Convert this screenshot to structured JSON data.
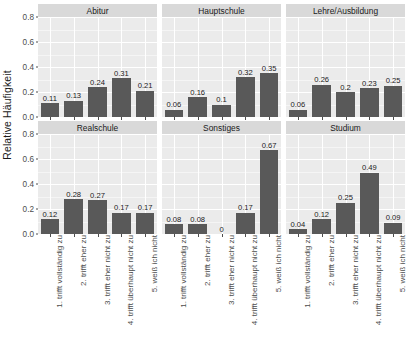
{
  "chart_data": {
    "type": "bar",
    "title": "",
    "subtitle": "",
    "xlabel": "",
    "ylabel": "Relative Häufigkeit",
    "ylim": [
      0,
      0.8
    ],
    "yticks": [
      "0.0",
      "0.2",
      "0.4",
      "0.6",
      "0.8"
    ],
    "ytick_values": [
      0.0,
      0.2,
      0.4,
      0.6,
      0.8
    ],
    "grid": true,
    "legend": "none",
    "facet_layout": {
      "rows": 2,
      "cols": 3
    },
    "categories": [
      "1. trifft vollständig zu",
      "2. trifft eher zu",
      "3. trifft eher nicht zu",
      "4. trifft überhaupt nicht zu",
      "5. weiß ich nicht"
    ],
    "panels": [
      {
        "name": "Abitur",
        "values": [
          0.11,
          0.13,
          0.24,
          0.31,
          0.21
        ],
        "labels": [
          "0.11",
          "0.13",
          "0.24",
          "0.31",
          "0.21"
        ]
      },
      {
        "name": "Hauptschule",
        "values": [
          0.06,
          0.16,
          0.1,
          0.32,
          0.35
        ],
        "labels": [
          "0.06",
          "0.16",
          "0.1",
          "0.32",
          "0.35"
        ]
      },
      {
        "name": "Lehre/Ausbildung",
        "values": [
          0.06,
          0.26,
          0.2,
          0.23,
          0.25
        ],
        "labels": [
          "0.06",
          "0.26",
          "0.2",
          "0.23",
          "0.25"
        ]
      },
      {
        "name": "Realschule",
        "values": [
          0.12,
          0.28,
          0.27,
          0.17,
          0.17
        ],
        "labels": [
          "0.12",
          "0.28",
          "0.27",
          "0.17",
          "0.17"
        ]
      },
      {
        "name": "Sonstiges",
        "values": [
          0.08,
          0.08,
          0,
          0.17,
          0.67
        ],
        "labels": [
          "0.08",
          "0.08",
          "0",
          "0.17",
          "0.67"
        ]
      },
      {
        "name": "Studium",
        "values": [
          0.04,
          0.12,
          0.25,
          0.49,
          0.09
        ],
        "labels": [
          "0.04",
          "0.12",
          "0.25",
          "0.49",
          "0.09"
        ]
      }
    ],
    "colors": {
      "bar": "#595959",
      "panel_background": "#ebebeb",
      "strip_background": "#d9d9d9",
      "gridline": "#ffffff",
      "text": "#1a1a1a",
      "axis_text": "#4d4d4d"
    }
  }
}
